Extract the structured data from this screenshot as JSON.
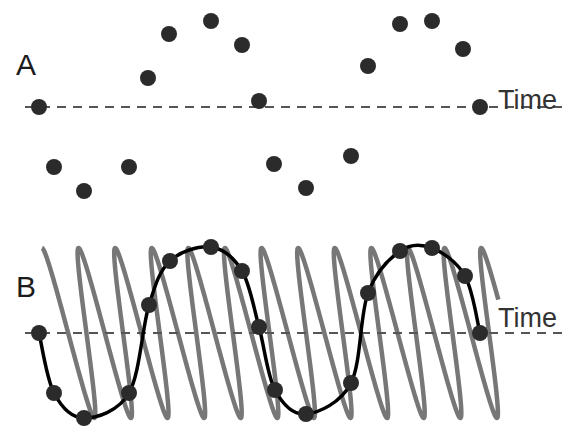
{
  "figure": {
    "colors": {
      "background": "#ffffff",
      "dot": "#2b2b2b",
      "axis_dash": "#555555",
      "carrier_wave": "#777777",
      "alias_curve": "#000000",
      "text": "#222222"
    }
  },
  "panels": [
    {
      "id": "A",
      "label": "A",
      "axis_label": "Time",
      "axis_y": 107,
      "axis_x_start": 25,
      "axis_x_end": 562,
      "label_pos": {
        "x": 16,
        "y": 50
      },
      "axis_label_pos": {
        "x": 498,
        "y": 87
      },
      "dots": [
        {
          "x": 39,
          "y": 107
        },
        {
          "x": 54,
          "y": 167
        },
        {
          "x": 84,
          "y": 191
        },
        {
          "x": 129,
          "y": 167
        },
        {
          "x": 148,
          "y": 78
        },
        {
          "x": 169,
          "y": 34
        },
        {
          "x": 211,
          "y": 21
        },
        {
          "x": 242,
          "y": 45
        },
        {
          "x": 259,
          "y": 101
        },
        {
          "x": 274,
          "y": 164
        },
        {
          "x": 306,
          "y": 188
        },
        {
          "x": 351,
          "y": 156
        },
        {
          "x": 368,
          "y": 66
        },
        {
          "x": 400,
          "y": 24
        },
        {
          "x": 432,
          "y": 21
        },
        {
          "x": 463,
          "y": 49
        },
        {
          "x": 480,
          "y": 107
        }
      ]
    },
    {
      "id": "B",
      "label": "B",
      "axis_label": "Time",
      "axis_y": 333,
      "axis_x_start": 25,
      "axis_x_end": 562,
      "label_pos": {
        "x": 16,
        "y": 272
      },
      "axis_label_pos": {
        "x": 498,
        "y": 305
      },
      "carrier_wave": {
        "type": "projected-coil",
        "x_start": 42,
        "x_end": 488,
        "mid_y": 333,
        "amplitude": 85,
        "pitch": 36.6,
        "loop_radius": 17,
        "stroke_width": 4.5
      },
      "alias_curve": {
        "type": "sine",
        "x_start": 39,
        "x_end": 480,
        "mid_y": 333,
        "amplitude": 85,
        "period": 442,
        "stroke_width": 3.5
      },
      "dots": [
        {
          "x": 39,
          "y": 333
        },
        {
          "x": 54,
          "y": 393
        },
        {
          "x": 84,
          "y": 418
        },
        {
          "x": 129,
          "y": 393
        },
        {
          "x": 149,
          "y": 305
        },
        {
          "x": 170,
          "y": 261
        },
        {
          "x": 211,
          "y": 247
        },
        {
          "x": 242,
          "y": 271
        },
        {
          "x": 259,
          "y": 327
        },
        {
          "x": 275,
          "y": 390
        },
        {
          "x": 306,
          "y": 414
        },
        {
          "x": 351,
          "y": 383
        },
        {
          "x": 368,
          "y": 293
        },
        {
          "x": 400,
          "y": 251
        },
        {
          "x": 432,
          "y": 248
        },
        {
          "x": 465,
          "y": 276
        },
        {
          "x": 480,
          "y": 333
        }
      ]
    }
  ],
  "dot_radius": 8
}
